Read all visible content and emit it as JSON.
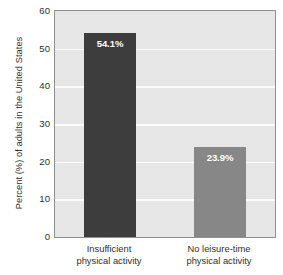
{
  "chart_data": {
    "type": "bar",
    "title": "",
    "xlabel": "",
    "ylabel": "Percent (%) of adults in the United States",
    "categories": [
      "Insufficient physical activity",
      "No leisure-time physical activity"
    ],
    "category_lines": [
      [
        "Insufficient",
        "physical activity"
      ],
      [
        "No leisure-time",
        "physical activity"
      ]
    ],
    "values": [
      54.1,
      23.9
    ],
    "value_labels": [
      "54.1%",
      "23.9%"
    ],
    "ylim": [
      0,
      60
    ],
    "yticks": [
      0,
      10,
      20,
      30,
      40,
      50,
      60
    ],
    "ytick_labels": [
      "0",
      "10",
      "20",
      "30",
      "40",
      "50",
      "60"
    ],
    "grid": "horizontal",
    "legend": "none",
    "bar_colors": [
      "#3d3d3d",
      "#878787"
    ],
    "plot_background": "#e9e9e9",
    "gridline_color": "#fbfbfb",
    "axis_border_color": "#8f8f8f",
    "value_label_color": "#ffffff"
  }
}
